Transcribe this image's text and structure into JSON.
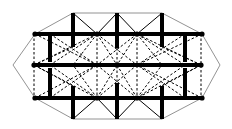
{
  "diagram": {
    "type": "graph-drawing",
    "colors": {
      "background": "#ffffff",
      "edge": "#000000",
      "outline": "#777777"
    },
    "vertices": {
      "L": [
        13,
        65
      ],
      "R": [
        220,
        65
      ],
      "T1": [
        73,
        13
      ],
      "T2": [
        117,
        13
      ],
      "T3": [
        162,
        13
      ],
      "B1": [
        73,
        119
      ],
      "B2": [
        117,
        119
      ],
      "B3": [
        162,
        119
      ],
      "UL": [
        35,
        34
      ],
      "UM1": [
        97,
        34
      ],
      "UM2": [
        137,
        34
      ],
      "UR": [
        202,
        34
      ],
      "ML": [
        34,
        65
      ],
      "MC": [
        117,
        65
      ],
      "MR": [
        201,
        65
      ],
      "LL": [
        35,
        98
      ],
      "LM1": [
        97,
        98
      ],
      "LM2": [
        137,
        98
      ],
      "LR": [
        202,
        98
      ]
    },
    "nodes": [
      "UL",
      "UM1",
      "UM2",
      "UR",
      "ML",
      "MC",
      "MR",
      "LL",
      "LM1",
      "LM2",
      "LR"
    ],
    "outline_edges": [
      [
        "L",
        "UL"
      ],
      [
        "UL",
        "T1"
      ],
      [
        "T1",
        "T2"
      ],
      [
        "T2",
        "T3"
      ],
      [
        "T3",
        "UR"
      ],
      [
        "UR",
        "R"
      ],
      [
        "R",
        "LR"
      ],
      [
        "LR",
        "B3"
      ],
      [
        "B3",
        "B2"
      ],
      [
        "B2",
        "B1"
      ],
      [
        "B1",
        "LL"
      ],
      [
        "LL",
        "L"
      ]
    ],
    "solid_edges": [
      [
        "T1",
        "UM1"
      ],
      [
        "UM1",
        "T2"
      ],
      [
        "T2",
        "UM2"
      ],
      [
        "UM2",
        "T3"
      ],
      [
        "B1",
        "LM1"
      ],
      [
        "LM1",
        "B2"
      ],
      [
        "B2",
        "LM2"
      ],
      [
        "LM2",
        "B3"
      ]
    ],
    "thick_edges": [
      [
        [
          35,
          34
        ],
        [
          202,
          34
        ]
      ],
      [
        [
          34,
          65
        ],
        [
          201,
          65
        ]
      ],
      [
        [
          35,
          98
        ],
        [
          202,
          98
        ]
      ],
      [
        [
          73,
          13
        ],
        [
          73,
          47
        ]
      ],
      [
        [
          117,
          13
        ],
        [
          117,
          48
        ]
      ],
      [
        [
          162,
          13
        ],
        [
          162,
          47
        ]
      ],
      [
        [
          50,
          34
        ],
        [
          50,
          62
        ]
      ],
      [
        [
          185,
          34
        ],
        [
          185,
          62
        ]
      ],
      [
        [
          50,
          68
        ],
        [
          50,
          98
        ]
      ],
      [
        [
          185,
          68
        ],
        [
          185,
          98
        ]
      ],
      [
        [
          73,
          86
        ],
        [
          73,
          119
        ]
      ],
      [
        [
          117,
          83
        ],
        [
          117,
          119
        ]
      ],
      [
        [
          162,
          86
        ],
        [
          162,
          119
        ]
      ]
    ],
    "dashed_edges": [
      [
        [
          34,
          34
        ],
        [
          34,
          98
        ]
      ],
      [
        [
          97,
          34
        ],
        [
          97,
          98
        ]
      ],
      [
        [
          137,
          34
        ],
        [
          137,
          98
        ]
      ],
      [
        [
          201,
          34
        ],
        [
          201,
          98
        ]
      ],
      [
        [
          117,
          48
        ],
        [
          117,
          83
        ]
      ],
      [
        [
          35,
          34
        ],
        [
          97,
          65
        ]
      ],
      [
        [
          34,
          65
        ],
        [
          97,
          34
        ]
      ],
      [
        [
          34,
          65
        ],
        [
          97,
          98
        ]
      ],
      [
        [
          35,
          98
        ],
        [
          97,
          65
        ]
      ],
      [
        [
          50,
          34
        ],
        [
          97,
          65
        ]
      ],
      [
        [
          73,
          47
        ],
        [
          34,
          65
        ]
      ],
      [
        [
          97,
          34
        ],
        [
          117,
          65
        ]
      ],
      [
        [
          137,
          34
        ],
        [
          117,
          65
        ]
      ],
      [
        [
          97,
          98
        ],
        [
          117,
          65
        ]
      ],
      [
        [
          137,
          98
        ],
        [
          117,
          65
        ]
      ],
      [
        [
          97,
          34
        ],
        [
          137,
          65
        ]
      ],
      [
        [
          137,
          34
        ],
        [
          97,
          65
        ]
      ],
      [
        [
          97,
          98
        ],
        [
          137,
          65
        ]
      ],
      [
        [
          137,
          98
        ],
        [
          97,
          65
        ]
      ],
      [
        [
          97,
          34
        ],
        [
          73,
          65
        ]
      ],
      [
        [
          97,
          98
        ],
        [
          73,
          65
        ]
      ],
      [
        [
          137,
          34
        ],
        [
          162,
          65
        ]
      ],
      [
        [
          137,
          98
        ],
        [
          162,
          65
        ]
      ],
      [
        [
          97,
          34
        ],
        [
          50,
          65
        ]
      ],
      [
        [
          97,
          98
        ],
        [
          50,
          65
        ]
      ],
      [
        [
          137,
          34
        ],
        [
          185,
          65
        ]
      ],
      [
        [
          137,
          98
        ],
        [
          185,
          65
        ]
      ],
      [
        [
          202,
          34
        ],
        [
          137,
          65
        ]
      ],
      [
        [
          201,
          65
        ],
        [
          137,
          34
        ]
      ],
      [
        [
          201,
          65
        ],
        [
          137,
          98
        ]
      ],
      [
        [
          202,
          98
        ],
        [
          137,
          65
        ]
      ],
      [
        [
          185,
          34
        ],
        [
          137,
          65
        ]
      ],
      [
        [
          162,
          47
        ],
        [
          201,
          65
        ]
      ],
      [
        [
          50,
          98
        ],
        [
          97,
          65
        ]
      ],
      [
        [
          73,
          86
        ],
        [
          34,
          65
        ]
      ],
      [
        [
          185,
          98
        ],
        [
          137,
          65
        ]
      ],
      [
        [
          162,
          86
        ],
        [
          201,
          65
        ]
      ]
    ]
  }
}
